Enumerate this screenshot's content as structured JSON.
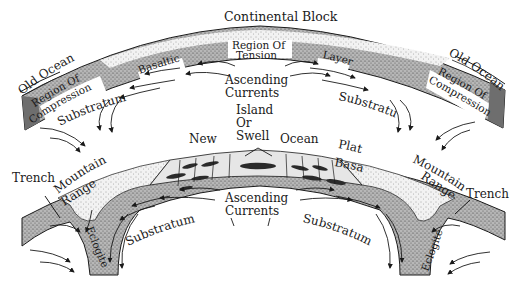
{
  "diagram": {
    "type": "geology-cross-section",
    "upper_panel": {
      "title": "Continental Block",
      "labels": {
        "old_ocean_left": "Old Ocean",
        "old_ocean_right": "Old Ocean",
        "compression_left": [
          "Region Of",
          "Compression"
        ],
        "compression_right": [
          "Region Of",
          "Compression"
        ],
        "tension": [
          "Region Of",
          "Tension"
        ],
        "basaltic": "Basaltic",
        "layer": "Layer",
        "ascending_currents": [
          "Ascending",
          "Currents"
        ],
        "substratum_left": "Substratum",
        "substratum_right": "Substratum"
      }
    },
    "middle_labels": {
      "island_or_swell": [
        "Island",
        "Or",
        "Swell"
      ],
      "new": "New",
      "ocean": "Ocean",
      "plateau_basalts": [
        "Plateau",
        "Basalts"
      ],
      "mountain_range_left": [
        "Mountain",
        "Range"
      ],
      "mountain_range_right": [
        "Mountain",
        "Range"
      ]
    },
    "lower_panel": {
      "labels": {
        "trench_left": "Trench",
        "trench_right": "Trench",
        "ascending_currents": [
          "Ascending",
          "Currents"
        ],
        "substratum_left": "Substratum",
        "substratum_right": "Substratum",
        "eclogite_left": "Eclogite",
        "eclogite_right": "Eclogite"
      }
    },
    "colors": {
      "ink": "#1a1a1a",
      "stipple_dark": "#8a8a8a",
      "stipple_light": "#d4d4d4",
      "ocean_floor": "#e6e6e6",
      "background": "#ffffff"
    }
  }
}
